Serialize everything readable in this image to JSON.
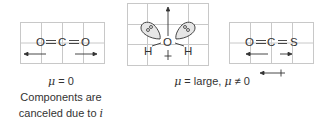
{
  "colors": {
    "grid": "#c8c8c8",
    "ink": "#333333",
    "lobe_fill": "#e6e6e6"
  },
  "panels": [
    {
      "id": "co2",
      "atoms": [
        "O",
        "C",
        "O"
      ],
      "bonds": [
        "=",
        "="
      ],
      "dipole_arrows": [
        "left",
        "right"
      ],
      "caption_lines": [
        "μ = 0",
        "Components are",
        "canceled due to i"
      ]
    },
    {
      "id": "h2o",
      "atoms": [
        "O",
        "H",
        "H"
      ],
      "lone_pairs": 2,
      "net_dipole": "up"
    },
    {
      "id": "ocs",
      "atoms": [
        "O",
        "C",
        "S"
      ],
      "bonds": [
        "=",
        "="
      ],
      "dipole_arrows": [
        "left",
        "right"
      ],
      "net_dipole": "left"
    }
  ],
  "captions": {
    "left_mu": "μ = 0",
    "left_line1": "Components are",
    "left_line2_prefix": "canceled due to ",
    "left_line2_italic": "i",
    "right_mu_prefix": "μ",
    "right_mid": " = large, ",
    "right_mu2": "μ",
    "right_suffix": " ≠ 0"
  },
  "labels": {
    "co2_o1": "O",
    "co2_c": "C",
    "co2_o2": "O",
    "h2o_o": "O",
    "h2o_h1": "H",
    "h2o_h2": "H",
    "ocs_o": "O",
    "ocs_c": "C",
    "ocs_s": "S"
  }
}
